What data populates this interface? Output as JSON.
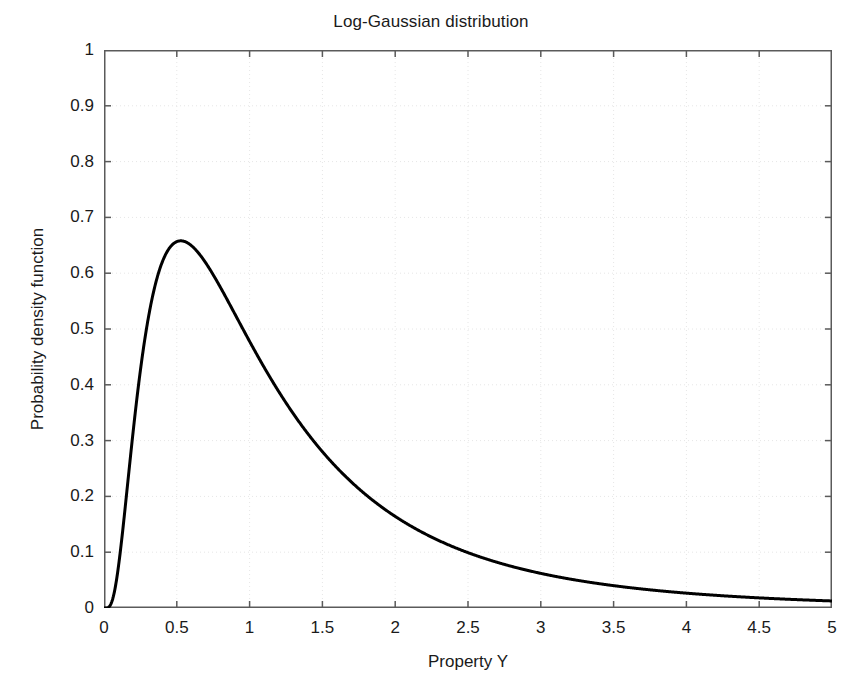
{
  "chart_data": {
    "type": "line",
    "title": "Log-Gaussian distribution",
    "xlabel": "Property Y",
    "ylabel": "Probability density function",
    "xlim": [
      0,
      5
    ],
    "ylim": [
      0,
      1
    ],
    "grid": true,
    "legend": null,
    "line_color": "#000000",
    "line_width": 3,
    "background_color": "#ffffff",
    "grid_color": "#e6e6e6",
    "axis_color": "#5a5a5a",
    "xticks": [
      0,
      0.5,
      1,
      1.5,
      2,
      2.5,
      3,
      3.5,
      4,
      4.5,
      5
    ],
    "xtick_labels": [
      "0",
      "0.5",
      "1",
      "1.5",
      "2",
      "2.5",
      "3",
      "3.5",
      "4",
      "4.5",
      "5"
    ],
    "yticks": [
      0,
      0.1,
      0.2,
      0.3,
      0.4,
      0.5,
      0.6,
      0.7,
      0.8,
      0.9,
      1
    ],
    "ytick_labels": [
      "0",
      "0.1",
      "0.2",
      "0.3",
      "0.4",
      "0.5",
      "0.6",
      "0.7",
      "0.8",
      "0.9",
      "1"
    ],
    "distribution": {
      "name": "lognormal",
      "mu": 0.0,
      "sigma": 0.8,
      "peak_x": 0.36,
      "peak_y": 0.658
    },
    "series": [
      {
        "name": "Log-Gaussian PDF",
        "x": [
          0.0,
          0.02,
          0.04,
          0.06,
          0.08,
          0.1,
          0.12,
          0.15,
          0.18,
          0.2,
          0.25,
          0.3,
          0.35,
          0.36,
          0.4,
          0.45,
          0.5,
          0.6,
          0.7,
          0.8,
          0.9,
          1.0,
          1.1,
          1.2,
          1.3,
          1.4,
          1.5,
          1.6,
          1.8,
          2.0,
          2.2,
          2.4,
          2.6,
          2.8,
          3.0,
          3.2,
          3.4,
          3.6,
          3.8,
          4.0,
          4.2,
          4.4,
          4.6,
          4.8,
          5.0
        ],
        "y": [
          0.0,
          0.0005,
          0.014,
          0.055,
          0.115,
          0.177,
          0.236,
          0.315,
          0.377,
          0.412,
          0.482,
          0.531,
          0.562,
          0.566,
          0.578,
          0.585,
          0.584,
          0.568,
          0.542,
          0.512,
          0.48,
          0.449,
          0.419,
          0.39,
          0.364,
          0.339,
          0.316,
          0.295,
          0.259,
          0.229,
          0.203,
          0.182,
          0.163,
          0.147,
          0.134,
          0.122,
          0.112,
          0.103,
          0.095,
          0.088,
          0.082,
          0.076,
          0.071,
          0.067,
          0.063
        ]
      }
    ]
  }
}
